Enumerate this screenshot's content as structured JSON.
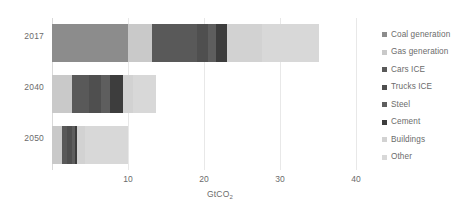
{
  "chart_data": {
    "type": "bar",
    "orientation": "horizontal",
    "stacked": true,
    "title": "",
    "subtitle": "",
    "xlabel": "GtCO2",
    "xlabel_display": "GtCO",
    "xlabel_subscript": "2",
    "ylabel": "",
    "categories": [
      "2017",
      "2040",
      "2050"
    ],
    "xlim": [
      0,
      40
    ],
    "xticks": [
      10,
      20,
      30,
      40
    ],
    "xtick_labels": [
      "10",
      "20",
      "30",
      "40"
    ],
    "grid": true,
    "grid_axis": "x",
    "legend_position": "right",
    "series": [
      {
        "name": "Coal generation",
        "color": "#8c8c8c",
        "values": [
          10.0,
          0.0,
          0.0
        ]
      },
      {
        "name": "Gas generation",
        "color": "#c9c9c9",
        "values": [
          3.2,
          2.6,
          1.3
        ]
      },
      {
        "name": "Cars ICE",
        "color": "#595959",
        "values": [
          5.9,
          2.3,
          0.7
        ]
      },
      {
        "name": "Trucks ICE",
        "color": "#4f4f4f",
        "values": [
          1.4,
          1.6,
          0.6
        ]
      },
      {
        "name": "Steel",
        "color": "#5e5e5e",
        "values": [
          1.1,
          1.2,
          0.4
        ]
      },
      {
        "name": "Cement",
        "color": "#3d3d3d",
        "values": [
          1.4,
          1.6,
          0.3
        ]
      },
      {
        "name": "Buildings",
        "color": "#d2d2d2",
        "values": [
          4.6,
          1.4,
          1.0
        ]
      },
      {
        "name": "Other",
        "color": "#d8d8d8",
        "values": [
          7.6,
          3.0,
          5.7
        ]
      }
    ],
    "totals": [
      35.2,
      13.7,
      10.0
    ]
  },
  "legend": {
    "items": [
      {
        "label": "Coal generation",
        "color": "#8c8c8c"
      },
      {
        "label": "Gas generation",
        "color": "#c9c9c9"
      },
      {
        "label": "Cars ICE",
        "color": "#595959"
      },
      {
        "label": "Trucks ICE",
        "color": "#4f4f4f"
      },
      {
        "label": "Steel",
        "color": "#5e5e5e"
      },
      {
        "label": "Cement",
        "color": "#3d3d3d"
      },
      {
        "label": "Buildings",
        "color": "#d2d2d2"
      },
      {
        "label": "Other",
        "color": "#d8d8d8"
      }
    ]
  },
  "colors": {
    "background": "#ffffff",
    "gridline": "#e8e8e8",
    "axis_line": "#d9d9d9",
    "text": "#6b6b6b"
  }
}
